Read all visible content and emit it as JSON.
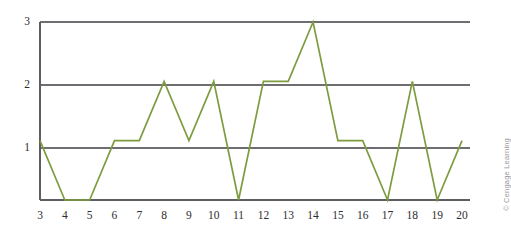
{
  "chart_data": {
    "type": "line",
    "title": "",
    "subtitle": "",
    "xlabel": "",
    "ylabel": "",
    "x": [
      3,
      4,
      5,
      6,
      7,
      8,
      9,
      10,
      11,
      12,
      13,
      14,
      15,
      16,
      17,
      18,
      19,
      20
    ],
    "values": [
      1,
      0,
      0,
      1,
      1,
      2,
      1,
      2,
      0,
      2,
      2,
      3,
      1,
      1,
      0,
      2,
      0,
      1
    ],
    "series": [
      {
        "name": "frequency",
        "values": [
          1,
          0,
          0,
          1,
          1,
          2,
          1,
          2,
          0,
          2,
          2,
          3,
          1,
          1,
          0,
          2,
          0,
          1
        ],
        "color": "#7d9c3f"
      }
    ],
    "x_tick_labels": [
      "3",
      "4",
      "5",
      "6",
      "7",
      "8",
      "9",
      "10",
      "11",
      "12",
      "13",
      "14",
      "15",
      "16",
      "17",
      "18",
      "19",
      "20"
    ],
    "y_tick_labels": [
      "1",
      "2",
      "3"
    ],
    "y_tick_values": [
      1,
      2,
      3
    ],
    "xlim": [
      3,
      20
    ],
    "ylim": [
      0,
      3
    ],
    "grid": "horizontal",
    "legend": "none",
    "line_color": "#7d9c3f",
    "grid_color": "#6e6e72",
    "axis_color": "#5d5d62",
    "background": "#ffffff"
  },
  "credit": {
    "text": "© Cengage Learning"
  }
}
